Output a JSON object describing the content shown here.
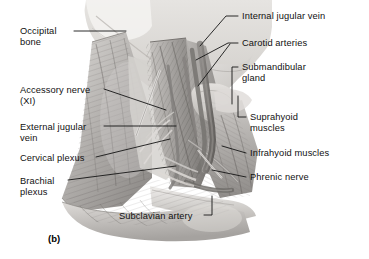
{
  "figure": {
    "panel_label": "(b)",
    "palette": {
      "background": "#ffffff",
      "leader_line": "#1a1a1a",
      "text": "#111111",
      "skin_light": "#e8e6e3",
      "skin_mid": "#c9c6c2",
      "muscle_light": "#cfcdca",
      "muscle_mid": "#a9a6a3",
      "muscle_dark": "#7d7a77",
      "vessel_dark": "#6e6b68",
      "bone_light": "#eeecea",
      "shadow": "#5a5856"
    }
  },
  "labels_left": [
    {
      "id": "occipital-bone",
      "text": "Occipital\nbone",
      "x": 20,
      "y": 26
    },
    {
      "id": "accessory-nerve",
      "text": "Accessory nerve\n(XI)",
      "x": 20,
      "y": 85
    },
    {
      "id": "external-jugular-vein",
      "text": "External jugular\nvein",
      "x": 20,
      "y": 122
    },
    {
      "id": "cervical-plexus",
      "text": "Cervical plexus",
      "x": 20,
      "y": 153
    },
    {
      "id": "brachial-plexus",
      "text": "Brachial\nplexus",
      "x": 20,
      "y": 176
    }
  ],
  "labels_right": [
    {
      "id": "internal-jugular-vein",
      "text": "Internal jugular vein",
      "x": 242,
      "y": 11
    },
    {
      "id": "carotid-arteries",
      "text": "Carotid arteries",
      "x": 242,
      "y": 38
    },
    {
      "id": "submandibular-gland",
      "text": "Submandibular\ngland",
      "x": 242,
      "y": 62
    },
    {
      "id": "suprahyoid-muscles",
      "text": "Suprahyoid\nmuscles",
      "x": 250,
      "y": 112
    },
    {
      "id": "infrahyoid-muscles",
      "text": "Infrahyoid muscles",
      "x": 250,
      "y": 148
    },
    {
      "id": "phrenic-nerve",
      "text": "Phrenic nerve",
      "x": 250,
      "y": 172
    }
  ],
  "labels_bottom": [
    {
      "id": "subclavian-artery",
      "text": "Subclavian artery",
      "x": 119,
      "y": 211
    }
  ]
}
